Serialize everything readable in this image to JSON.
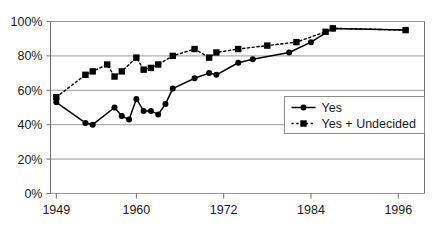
{
  "chart_data": {
    "type": "line",
    "title": "",
    "subtitle": "",
    "xlabel": "",
    "ylabel": "",
    "xlim": [
      1949,
      1999
    ],
    "ylim": [
      0,
      1.0
    ],
    "grid": "horizontal",
    "legend_position": "inside-lower-right",
    "y_ticks": [
      "0%",
      "20%",
      "40%",
      "60%",
      "80%",
      "100%"
    ],
    "y_tick_values": [
      0,
      20,
      40,
      60,
      80,
      100
    ],
    "x_ticks": [
      "1949",
      "1960",
      "1972",
      "1984",
      "1996"
    ],
    "x_tick_values": [
      1949,
      1960,
      1972,
      1984,
      1996
    ],
    "series": [
      {
        "name": "Yes",
        "marker": "circle",
        "line_style": "solid",
        "color": "#000000",
        "points": [
          {
            "x": 1949,
            "y": 53
          },
          {
            "x": 1953,
            "y": 41
          },
          {
            "x": 1954,
            "y": 40
          },
          {
            "x": 1957,
            "y": 50
          },
          {
            "x": 1958,
            "y": 45
          },
          {
            "x": 1959,
            "y": 43
          },
          {
            "x": 1960,
            "y": 55
          },
          {
            "x": 1961,
            "y": 48
          },
          {
            "x": 1962,
            "y": 48
          },
          {
            "x": 1963,
            "y": 46
          },
          {
            "x": 1964,
            "y": 52
          },
          {
            "x": 1965,
            "y": 61
          },
          {
            "x": 1968,
            "y": 67
          },
          {
            "x": 1970,
            "y": 70
          },
          {
            "x": 1971,
            "y": 69
          },
          {
            "x": 1974,
            "y": 76
          },
          {
            "x": 1976,
            "y": 78
          },
          {
            "x": 1981,
            "y": 82
          },
          {
            "x": 1984,
            "y": 88
          },
          {
            "x": 1987,
            "y": 96
          },
          {
            "x": 1997,
            "y": 95
          }
        ]
      },
      {
        "name": "Yes + Undecided",
        "marker": "square",
        "line_style": "dotted",
        "color": "#000000",
        "points": [
          {
            "x": 1949,
            "y": 56
          },
          {
            "x": 1953,
            "y": 69
          },
          {
            "x": 1954,
            "y": 71
          },
          {
            "x": 1956,
            "y": 75
          },
          {
            "x": 1957,
            "y": 68
          },
          {
            "x": 1958,
            "y": 71
          },
          {
            "x": 1960,
            "y": 79
          },
          {
            "x": 1961,
            "y": 72
          },
          {
            "x": 1962,
            "y": 73
          },
          {
            "x": 1963,
            "y": 75
          },
          {
            "x": 1965,
            "y": 80
          },
          {
            "x": 1968,
            "y": 84
          },
          {
            "x": 1970,
            "y": 79
          },
          {
            "x": 1971,
            "y": 82
          },
          {
            "x": 1974,
            "y": 84
          },
          {
            "x": 1978,
            "y": 86
          },
          {
            "x": 1982,
            "y": 88
          },
          {
            "x": 1986,
            "y": 94
          },
          {
            "x": 1987,
            "y": 96
          },
          {
            "x": 1997,
            "y": 95
          }
        ]
      }
    ]
  },
  "legend": {
    "entries": [
      {
        "label": "Yes",
        "marker": "circle",
        "style": "solid"
      },
      {
        "label": "Yes + Undecided",
        "marker": "square",
        "style": "dotted"
      }
    ]
  },
  "colors": {
    "series": "#000000",
    "gridline": "#9a9a9a",
    "axis": "#6f6f6f",
    "text": "#1a1a1a",
    "plot_background": "#ffffff",
    "legend_border": "#8c8c8c"
  }
}
